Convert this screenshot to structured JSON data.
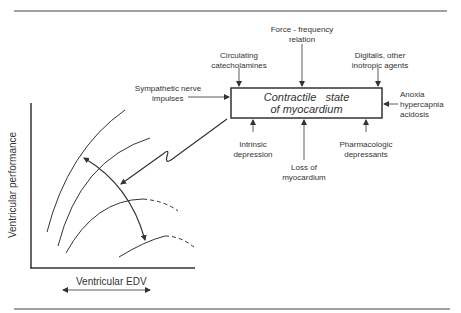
{
  "diagram": {
    "central_box": {
      "line1": "Contractile   state",
      "line2": "of myocardium"
    },
    "inputs_top": [
      {
        "line1": "Circulating",
        "line2": "catecholamines"
      },
      {
        "line1": "Force - frequency",
        "line2": "relation"
      },
      {
        "line1": "Digitalis, other",
        "line2": "inotropic agents"
      }
    ],
    "input_left": {
      "line1": "Sympathetic nerve",
      "line2": "impulses"
    },
    "input_right": {
      "line1": "Anoxia",
      "line2": "hypercapnia",
      "line3": "acidosis"
    },
    "inputs_bottom": [
      {
        "line1": "Intrinsic",
        "line2": "depression"
      },
      {
        "line1": "Loss of",
        "line2": "myocardium"
      },
      {
        "line1": "Pharmacologic",
        "line2": "depressants"
      }
    ],
    "graph": {
      "y_axis_label": "Ventricular performance",
      "x_axis_label": "Ventricular EDV",
      "curve_count": 4
    },
    "colors": {
      "line": "#333333",
      "background": "#ffffff"
    }
  }
}
